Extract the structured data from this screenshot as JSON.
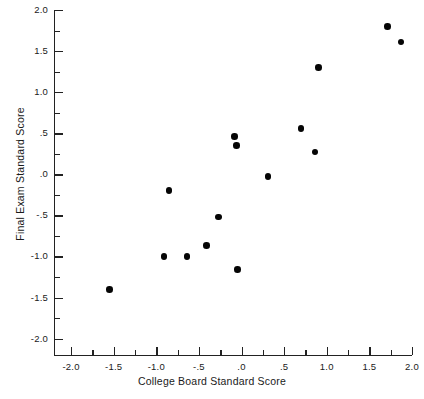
{
  "chart_data": {
    "type": "scatter",
    "title": "",
    "xlabel": "College Board Standard Score",
    "ylabel": "Final Exam Standard Score",
    "xlim": [
      -2.2,
      2.0
    ],
    "ylim": [
      -2.2,
      2.0
    ],
    "grid": false,
    "legend": null,
    "x_major_ticks": [
      -2.0,
      -1.5,
      -1.0,
      -0.5,
      0.0,
      0.5,
      1.0,
      1.5,
      2.0
    ],
    "x_tick_labels": [
      "-2.0",
      "-1.5",
      "-1.0",
      "-.5",
      ".0",
      ".5",
      "1.0",
      "1.5",
      "2.0"
    ],
    "x_minor_ticks": [
      -1.75,
      -1.25,
      -0.75,
      -0.25,
      0.25,
      0.75,
      1.25,
      1.75
    ],
    "y_major_ticks": [
      -2.0,
      -1.5,
      -1.0,
      -0.5,
      0.0,
      0.5,
      1.0,
      1.5,
      2.0
    ],
    "y_tick_labels": [
      "-2.0",
      "-1.5",
      "-1.0",
      "-.5",
      ".0",
      ".5",
      "1.0",
      "1.5",
      "2.0"
    ],
    "y_minor_ticks": [
      -1.75,
      -1.25,
      -0.75,
      -0.25,
      0.25,
      0.75,
      1.25,
      1.75
    ],
    "marker": "filled-circle",
    "marker_color": "#050505",
    "marker_size": 6.6,
    "n_points": 15,
    "points": [
      {
        "x": -1.55,
        "y": -1.4
      },
      {
        "x": -0.91,
        "y": -1.0
      },
      {
        "x": -0.85,
        "y": -0.2
      },
      {
        "x": -0.64,
        "y": -1.0
      },
      {
        "x": -0.41,
        "y": -0.87
      },
      {
        "x": -0.27,
        "y": -0.52
      },
      {
        "x": -0.08,
        "y": 0.46
      },
      {
        "x": -0.06,
        "y": 0.35
      },
      {
        "x": -0.05,
        "y": -1.16
      },
      {
        "x": 0.31,
        "y": -0.03
      },
      {
        "x": 0.7,
        "y": 0.56
      },
      {
        "x": 0.86,
        "y": 0.27
      },
      {
        "x": 0.9,
        "y": 1.3
      },
      {
        "x": 1.71,
        "y": 1.8
      },
      {
        "x": 1.87,
        "y": 1.61
      }
    ]
  },
  "axis_color": "#222222",
  "background_color": "#ffffff"
}
